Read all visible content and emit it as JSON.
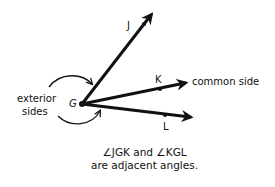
{
  "diagram": {
    "title": "Adjacent angles",
    "vertex": {
      "label": "G",
      "x": 82,
      "y": 104
    },
    "rays": [
      {
        "point_label": "J",
        "end": [
          153,
          12
        ],
        "dot": [
          144,
          24
        ]
      },
      {
        "point_label": "K",
        "end": [
          188,
          82
        ],
        "dot": [
          160,
          89
        ]
      },
      {
        "point_label": "L",
        "end": [
          193,
          118
        ],
        "dot": [
          165,
          115
        ]
      }
    ],
    "annotations": {
      "exterior_sides_line1": "exterior",
      "exterior_sides_line2": "sides",
      "common_side": "common side"
    },
    "caption": {
      "line1": "∠JGK and ∠KGL",
      "line2": "are adjacent angles."
    },
    "colors": {
      "ink": "#111111",
      "background": "#ffffff"
    }
  }
}
